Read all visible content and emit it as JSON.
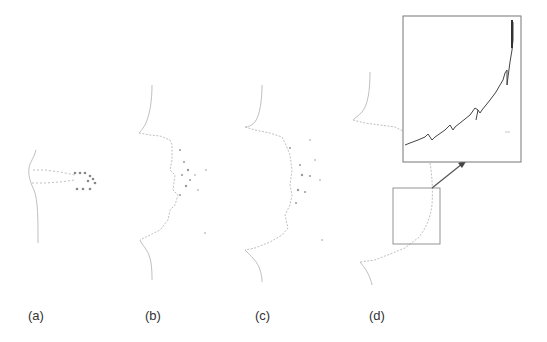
{
  "figure": {
    "panels": [
      {
        "id": "a",
        "label": "(a)"
      },
      {
        "id": "b",
        "label": "(b)"
      },
      {
        "id": "c",
        "label": "(c)"
      },
      {
        "id": "d",
        "label": "(d)"
      }
    ],
    "colors": {
      "outline": "#b0b0b0",
      "particles": "#888888",
      "inset_border": "#777777",
      "inset_curve": "#444444",
      "arrow": "#555555"
    }
  }
}
